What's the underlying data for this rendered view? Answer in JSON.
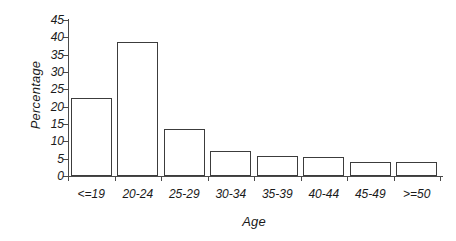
{
  "chart_data": {
    "type": "bar",
    "title": "",
    "xlabel": "Age",
    "ylabel": "Percentage",
    "categories": [
      "<=19",
      "20-24",
      "25-29",
      "30-34",
      "35-39",
      "40-44",
      "45-49",
      ">=50"
    ],
    "values": [
      22.4,
      38.8,
      13.6,
      7.2,
      5.7,
      5.6,
      4.0,
      4.0
    ],
    "yticks": [
      0,
      5,
      10,
      15,
      20,
      25,
      30,
      35,
      40,
      45
    ],
    "ytick_labels": [
      "0",
      "5",
      "10",
      "15",
      "20",
      "25",
      "30",
      "35",
      "40",
      "45"
    ],
    "ylim": [
      0,
      45
    ],
    "grid": false,
    "legend": null,
    "series": [
      {
        "name": "Percentage",
        "values": [
          22.4,
          38.8,
          13.6,
          7.2,
          5.7,
          5.6,
          4.0,
          4.0
        ]
      }
    ],
    "bar_fill_color": "#ffffff",
    "bar_edge_color": "#3c3c3c",
    "axis_color": "#4a4a4a"
  }
}
